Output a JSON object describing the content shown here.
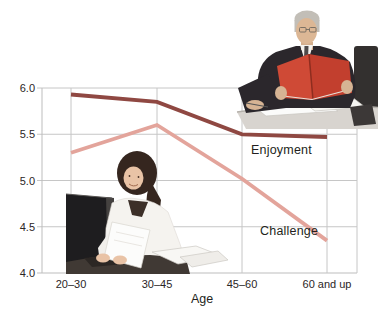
{
  "figure": {
    "width": 378,
    "height": 323,
    "background": "#ffffff"
  },
  "chart_data": {
    "type": "line",
    "title": "",
    "xlabel": "Age",
    "ylabel": "",
    "categories": [
      "20–30",
      "30–45",
      "45–60",
      "60 and up"
    ],
    "series": [
      {
        "name": "Enjoyment",
        "values": [
          5.93,
          5.85,
          5.5,
          5.47
        ],
        "color": "#8f4842"
      },
      {
        "name": "Challenge",
        "values": [
          5.3,
          5.6,
          5.02,
          4.35
        ],
        "color": "#e3a49b"
      }
    ],
    "ylim": [
      4.0,
      6.0
    ],
    "yticks": [
      "6.0",
      "5.5",
      "5.0",
      "4.5",
      "4.0"
    ],
    "grid": true,
    "legend_position": "inline labels beside line ends"
  },
  "photos": [
    {
      "description": "older man in dark suit reading an open red folder at a desk",
      "position": "top-right"
    },
    {
      "description": "young woman with dark hair in white blouse holding papers beside a dark computer monitor",
      "position": "bottom-left"
    }
  ],
  "colors": {
    "grid_line": "#c6c6c6",
    "axis_line": "#bdbdbd",
    "tick_text": "#2b2626",
    "enjoyment_line": "#8f4842",
    "challenge_line": "#e3a49b",
    "folder_red": "#c23f2e"
  }
}
